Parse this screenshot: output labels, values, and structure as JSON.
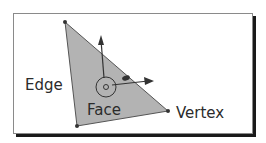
{
  "labels": {
    "edge": "Edge",
    "face": "Face",
    "vertex": "Vertex"
  },
  "colors": {
    "face_fill": "#b3b3b3",
    "stroke": "#333333",
    "shadow": "#1a1a1a"
  }
}
